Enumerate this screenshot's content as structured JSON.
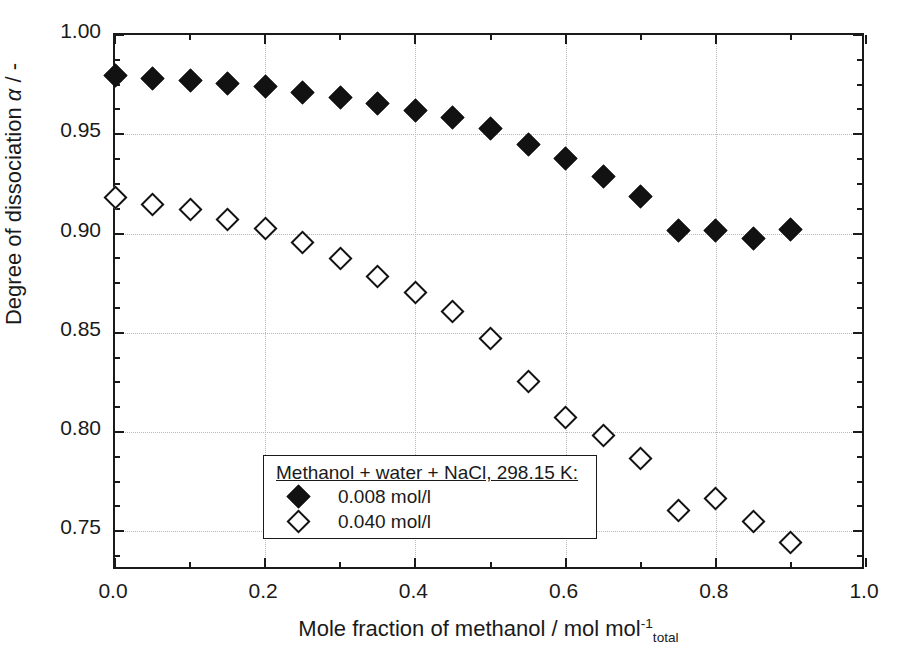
{
  "chart_data": {
    "type": "scatter",
    "title": "",
    "xlabel": "Mole fraction of methanol / mol mol",
    "xlabel_sup": "-1",
    "xlabel_sub": "total",
    "ylabel_prefix": "Degree of dissociation ",
    "ylabel_symbol": "α",
    "ylabel_suffix": " / -",
    "xlim": [
      0.0,
      1.0
    ],
    "ylim": [
      0.73,
      1.0
    ],
    "xticks": [
      0.0,
      0.2,
      0.4,
      0.6,
      0.8,
      1.0
    ],
    "xticklabels": [
      "0.0",
      "0.2",
      "0.4",
      "0.6",
      "0.8",
      "1.0"
    ],
    "xminor_step": 0.05,
    "yticks": [
      0.75,
      0.8,
      0.85,
      0.9,
      0.95,
      1.0
    ],
    "yticklabels": [
      "0.75",
      "0.80",
      "0.85",
      "0.90",
      "0.95",
      "1.00"
    ],
    "yminor_step": 0.0125,
    "grid": true,
    "legend_position": "lower-left-inside",
    "legend_title": "Methanol + water + NaCl, 298.15 K:",
    "series": [
      {
        "name": "0.008 mol/l",
        "marker": "filled-diamond",
        "color": "#121212",
        "x": [
          0.0,
          0.05,
          0.1,
          0.15,
          0.2,
          0.25,
          0.3,
          0.35,
          0.4,
          0.45,
          0.5,
          0.55,
          0.6,
          0.65,
          0.7,
          0.75,
          0.8,
          0.85,
          0.9
        ],
        "values": [
          0.9795,
          0.978,
          0.977,
          0.9755,
          0.974,
          0.971,
          0.9685,
          0.9655,
          0.962,
          0.9585,
          0.953,
          0.945,
          0.938,
          0.9285,
          0.9185,
          0.9015,
          0.9015,
          0.8975,
          0.902
        ]
      },
      {
        "name": "0.040 mol/l",
        "marker": "open-diamond",
        "color": "#121212",
        "x": [
          0.0,
          0.05,
          0.1,
          0.15,
          0.2,
          0.25,
          0.3,
          0.35,
          0.4,
          0.45,
          0.5,
          0.55,
          0.6,
          0.65,
          0.7,
          0.75,
          0.8,
          0.85,
          0.9
        ],
        "values": [
          0.918,
          0.9145,
          0.912,
          0.907,
          0.9025,
          0.8955,
          0.8875,
          0.8785,
          0.8705,
          0.8605,
          0.847,
          0.8255,
          0.8075,
          0.7985,
          0.7865,
          0.7605,
          0.7665,
          0.755,
          0.7445
        ]
      }
    ]
  }
}
